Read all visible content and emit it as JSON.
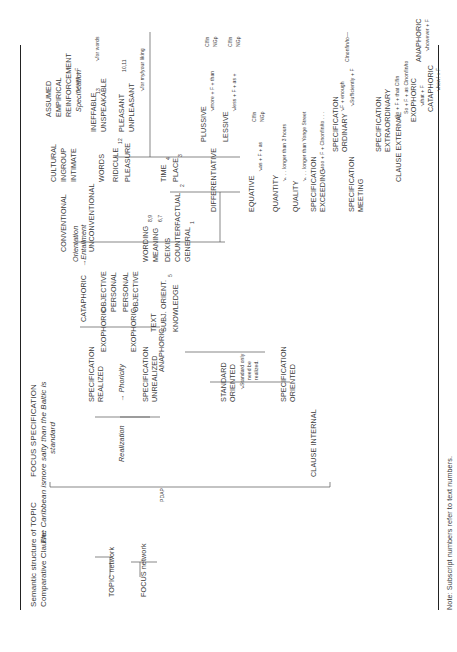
{
  "header": {
    "title_line1": "Semantic structure of",
    "title_line2": "Comparative Clause:",
    "topic_label": "TOPIC",
    "topic_example": "The Caribbean is",
    "focus_label": "FOCUS SPECIFICATION",
    "focus_example_line1": "more salty than the Baltic is",
    "focus_example_line2": "standard"
  },
  "left_networks": {
    "topic_network": "TOPIC network",
    "focus_network": "FOCUS network",
    "focus_note": "PDAP"
  },
  "systems": {
    "realization": "Realization",
    "orientation": "Orientation",
    "specification": "Specification"
  },
  "realization": {
    "arrow": "→ Phoricity",
    "realized": [
      "SPECIFICATION",
      "REALIZED"
    ],
    "unrealized": [
      "SPECIFICATION",
      "UNREALIZED"
    ]
  },
  "phoricity": {
    "cataphoric": "CATAPHORIC",
    "entailment": "→Entailment",
    "exophoric_1": "EXOPHORIC",
    "exophoric_2": "EXOPHORIC",
    "anaphoric": "ANAPHORIC",
    "objective_1": "OBJECTIVE",
    "personal_1": "PERSONAL",
    "personal_2": "PERSONAL",
    "objective_2": "OBJECTIVE",
    "text": "TEXT",
    "subj_orient": "SUBJ. ORIENT.",
    "subj_orient_sub": "5",
    "knowledge": "KNOWLEDGE",
    "wording": "WORDING",
    "wording_sub": "8,9",
    "meaning": "MEANING",
    "meaning_sub": "6,7",
    "deixis": "DEIXIS",
    "counterfactual": "COUNTERFACTUAL",
    "counterfactual_sub": "2",
    "general": "GENERAL",
    "general_sub": "1",
    "time": "TIME",
    "time_sub": "4",
    "place": "PLACE",
    "place_sub": "3",
    "conventional": "CONVENTIONAL",
    "unconventional": "UNCONVENTIONAL",
    "cultural": "CULTURAL",
    "ingroup": "INGROUP",
    "intimate": "INTIMATE",
    "assumed": "ASSUMED",
    "empirical": "EMPIRICAL",
    "reinforcement": "REINFORCEMENT",
    "reinforcement_note": "↘even + F",
    "words": "WORDS",
    "ineffable": "INEFFABLE",
    "ineffable_sub": "13",
    "unspeakable": "UNSPEAKABLE",
    "words_note": "↘for words",
    "ridicule": "RIDICULE",
    "ridicule_sub": "12",
    "pleasure": "PLEASURE",
    "pleasant": "PLEASANT",
    "unpleasant": "UNPLEASANT",
    "unpleasant_sub": "10,11",
    "pleasure_note": "↘for my/your liking"
  },
  "orientation": {
    "standard_oriented": [
      "STANDARD",
      "ORIENTED"
    ],
    "standard_note": [
      "↘Standard only",
      "need be",
      "realized."
    ],
    "specification_oriented": [
      "SPECIFICATION",
      "ORIENTED"
    ],
    "differentiative": "DIFFERENTIATIVE",
    "plussive": "PLUSSIVE",
    "plussive_formula": "↘more + F + than",
    "lessive": "LESSIVE",
    "lessive_formula": "↘less + F + as +",
    "cl_fin": "Clfin",
    "ng_p": "NGp",
    "equative": "EQUATIVE",
    "equative_formula": "↘as + F + as",
    "quantity": "QUANTITY",
    "quantity_example": "↘. . . longer than 3 hours",
    "quality": "QUALITY",
    "quality_example": "↘. . . longer than Yonge Street",
    "spec_exceeding": [
      "SPECIFICATION",
      "EXCEEDING"
    ],
    "exceeding_formula": "↘too + F + Clnonfin/to . . .",
    "spec_meeting": [
      "SPECIFICATION",
      "MEETING"
    ],
    "spec_ordinary": [
      "SPECIFICATION",
      "ORDINARY"
    ],
    "ordinary_formula_1": "↘F + enough",
    "ordinary_formula_2": "↘Sufficiently + F",
    "ordinary_result": "Clnonfin/to—",
    "spec_extraordinary": [
      "SPECIFICATION",
      "EXTRAORDINARY"
    ],
    "extraordinary_formula_1": "↘So + F + that Clfin",
    "extraordinary_formula_2": "So + F + as Clnonfin/to"
  },
  "specification": {
    "clause_internal": "CLAUSE INTERNAL",
    "clause_external": "CLAUSE EXTERNAL",
    "exophoric": "EXOPHORIC",
    "exophoric_formula": "↘that + F",
    "cataphoric": "CATAPHORIC",
    "cataphoric_formula": "↘how! + F",
    "anaphoric": "ANAPHORIC",
    "anaphoric_formula": "↘however + F"
  },
  "footer": {
    "note": "Note:  Subscript numbers refer to text numbers."
  }
}
